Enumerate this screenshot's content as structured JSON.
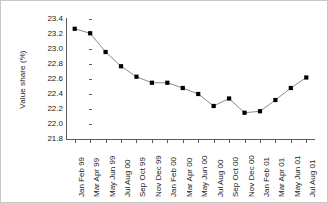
{
  "chart_data": {
    "type": "line",
    "title": "",
    "xlabel": "",
    "ylabel": "Value share (%)",
    "ylim": [
      21.8,
      23.4
    ],
    "yticks": [
      "23.4",
      "23.2",
      "23.0",
      "22.8",
      "22.6",
      "22.4",
      "22.2",
      "22.0",
      "21.8"
    ],
    "ytick_values": [
      23.4,
      23.2,
      23.0,
      22.8,
      22.6,
      22.4,
      22.2,
      22.0,
      21.8
    ],
    "grid": false,
    "legend": false,
    "legend_position": "none",
    "marker": "square",
    "marker_color": "#000000",
    "line_color": "#808080",
    "categories": [
      "Jan Feb 99",
      "Mar Apr 99",
      "May Jun 99",
      "Jul Aug 00",
      "Sep Oct 99",
      "Nov Dec 99",
      "Jan Feb 00",
      "Mar Apr 00",
      "May Jun 00",
      "Jul Aug 00",
      "Sep Oct 00",
      "Nov Dec 00",
      "Jan Feb 01",
      "Mar Apr 01",
      "May Jun 01",
      "Jul Aug 01"
    ],
    "values": [
      23.27,
      23.21,
      22.96,
      22.77,
      22.63,
      22.55,
      22.55,
      22.48,
      22.4,
      22.24,
      22.34,
      22.15,
      22.17,
      22.32,
      22.48,
      22.62
    ]
  }
}
